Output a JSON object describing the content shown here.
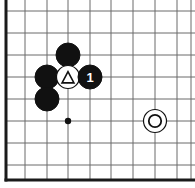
{
  "board": {
    "title": "Go board diagram",
    "background_color": "#ffffff",
    "grid_line_color": "#6b6b6b",
    "border_color": "#1a1a1a",
    "grid_spacing": 22,
    "origin_x": 6,
    "origin_y": 11,
    "border_left_x": 6,
    "border_bottom_y": 180,
    "vertical_lines_x": [
      6,
      25,
      47,
      68,
      90,
      111,
      133,
      155,
      177,
      191
    ],
    "horizontal_lines_y": [
      11,
      33,
      55,
      77,
      99,
      121,
      143,
      165,
      180
    ],
    "star_points": [
      {
        "name": "hoshi",
        "cx": 68,
        "cy": 121,
        "r": 3.2,
        "color": "#111111"
      }
    ],
    "stone_radius": 11.5,
    "black_color": "#111111",
    "white_color": "#ffffff",
    "white_edge_color": "#111111"
  },
  "stones": [
    {
      "id": "black-upper",
      "name": "black-stone",
      "color": "black",
      "cx": 68,
      "cy": 55,
      "r": 12,
      "mark": "none",
      "label": ""
    },
    {
      "id": "black-left-upper",
      "name": "black-stone",
      "color": "black",
      "cx": 47,
      "cy": 77,
      "r": 12,
      "mark": "none",
      "label": ""
    },
    {
      "id": "black-left-lower",
      "name": "black-stone",
      "color": "black",
      "cx": 47,
      "cy": 99,
      "r": 12,
      "mark": "none",
      "label": ""
    },
    {
      "id": "white-triangle",
      "name": "white-stone-triangle",
      "color": "white",
      "cx": 68,
      "cy": 77,
      "r": 11.5,
      "mark": "triangle",
      "label": ""
    },
    {
      "id": "black-move-1",
      "name": "black-stone-numbered",
      "color": "black",
      "cx": 90,
      "cy": 77,
      "r": 12,
      "mark": "number",
      "label": "1"
    },
    {
      "id": "white-circle",
      "name": "white-stone-circle",
      "color": "white",
      "cx": 155,
      "cy": 121,
      "r": 11.5,
      "mark": "circle",
      "label": ""
    }
  ],
  "marks": {
    "triangle_stroke": "#111111",
    "triangle_size": 9,
    "circle_mark_r": 6.2,
    "circle_mark_stroke": "#111111",
    "number_color": "#ffffff",
    "number_font_size": 13
  }
}
